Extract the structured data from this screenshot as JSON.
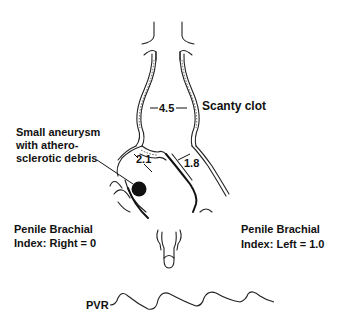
{
  "diagram": {
    "labels": {
      "aortic_diameter": "4.5",
      "aortic_note": "Scanty clot",
      "aneurysm_line1": "Small aneurysm",
      "aneurysm_line2": "with athero-",
      "aneurysm_line3": "sclerotic debris",
      "right_iliac_diameter": "2.1",
      "left_iliac_diameter": "1.8",
      "pbi_right_line1": "Penile Brachial",
      "pbi_right_line2": "Index: Right = 0",
      "pbi_left_line1": "Penile Brachial",
      "pbi_left_line2": "Index: Left = 1.0",
      "pvr_label": "PVR"
    },
    "colors": {
      "ink": "#111111",
      "background": "#ffffff"
    }
  }
}
